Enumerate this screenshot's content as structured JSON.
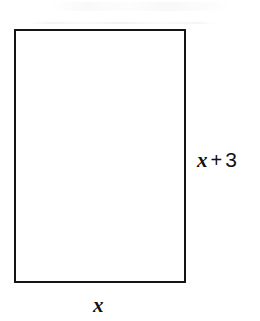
{
  "figure": {
    "type": "geometry-diagram",
    "shape": "rectangle",
    "background_color": "#ffffff",
    "stroke_color": "#141414"
  },
  "labels": {
    "height": {
      "full_text": "x + 3",
      "variable": "x",
      "operator": "+",
      "constant": "3",
      "position": "right"
    },
    "width": {
      "full_text": "x",
      "variable": "x",
      "position": "bottom"
    }
  },
  "chart_data": {
    "type": "diagram",
    "shape": "rectangle",
    "title": "",
    "annotations": [
      {
        "label": "x + 3",
        "side": "right",
        "meaning": "height"
      },
      {
        "label": "x",
        "side": "bottom",
        "meaning": "width"
      }
    ],
    "geometry": {
      "left": 14,
      "top": 29,
      "width": 172,
      "height": 254,
      "stroke_width": 2
    }
  }
}
